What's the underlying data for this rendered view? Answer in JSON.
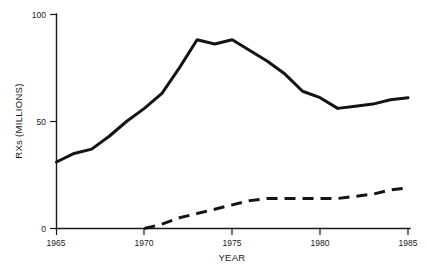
{
  "chart_data": {
    "type": "line",
    "title": "",
    "xlabel": "YEAR",
    "ylabel": "RXs (MILLIONS)",
    "xlim": [
      1965,
      1985
    ],
    "ylim": [
      0,
      100
    ],
    "xticks": [
      1965,
      1970,
      1975,
      1980,
      1985
    ],
    "xticklabels": [
      "1965",
      "1970",
      "1975",
      "1980",
      "1985"
    ],
    "yticks": [
      0,
      50,
      100
    ],
    "yticklabels": [
      "0",
      "50",
      "100"
    ],
    "grid": false,
    "legend": "none",
    "series": [
      {
        "name": "solid-line",
        "style": "solid",
        "color": "#141414",
        "x": [
          1965,
          1966,
          1967,
          1968,
          1969,
          1970,
          1971,
          1972,
          1973,
          1974,
          1975,
          1976,
          1977,
          1978,
          1979,
          1980,
          1981,
          1982,
          1983,
          1984,
          1985
        ],
        "values": [
          31,
          35,
          37,
          43,
          50,
          56,
          63,
          75,
          88,
          86,
          88,
          83,
          78,
          72,
          64,
          61,
          56,
          57,
          58,
          60,
          61
        ]
      },
      {
        "name": "dashed-line",
        "style": "dashed",
        "color": "#141414",
        "x": [
          1970,
          1971,
          1972,
          1973,
          1974,
          1975,
          1976,
          1977,
          1978,
          1979,
          1980,
          1981,
          1982,
          1983,
          1984,
          1985
        ],
        "values": [
          0,
          2,
          5,
          7,
          9,
          11,
          13,
          14,
          14,
          14,
          14,
          14,
          15,
          16,
          18,
          19
        ]
      }
    ]
  },
  "axis": {
    "y_title": "RXs (MILLIONS)",
    "x_title": "YEAR",
    "y_tick_top": "100",
    "y_tick_mid": "50",
    "y_tick_bottom": "0",
    "x_tick_1": "1965",
    "x_tick_2": "1970",
    "x_tick_3": "1975",
    "x_tick_4": "1980",
    "x_tick_5": "1985"
  }
}
